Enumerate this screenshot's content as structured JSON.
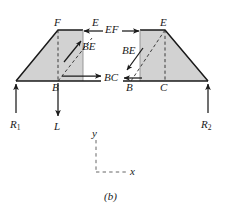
{
  "figure": {
    "caption": "(b)",
    "type": "free-body-diagram"
  },
  "colors": {
    "fill_gray": "#d2d2d2",
    "stroke": "#1a1a1a",
    "axis": "#555555",
    "background": "#ffffff"
  },
  "labels": {
    "joint_F_left": "F",
    "force_E_top_left": "E",
    "force_EF_center": "EF",
    "joint_E_right": "E",
    "force_BE_left": "BE",
    "force_BE_right": "BE",
    "joint_B_left": "B",
    "force_BC_center": "BC",
    "joint_B_right": "B",
    "joint_C_right": "C",
    "reaction_left": "R",
    "reaction_left_sub": "1",
    "load_L": "L",
    "reaction_right": "R",
    "reaction_right_sub": "2",
    "axis_y": "y",
    "axis_x": "x"
  },
  "forces": [
    {
      "name": "EF",
      "side": "left",
      "direction": "left",
      "applied_at": "F-top-right"
    },
    {
      "name": "EF",
      "side": "right",
      "direction": "right",
      "applied_at": "E-top-left"
    },
    {
      "name": "BE",
      "side": "left",
      "direction": "up-right",
      "applied_at": "diagonal"
    },
    {
      "name": "BE",
      "side": "right",
      "direction": "down-left",
      "applied_at": "diagonal"
    },
    {
      "name": "BC",
      "side": "left",
      "direction": "right",
      "applied_at": "B-baseline"
    },
    {
      "name": "BC",
      "side": "right",
      "direction": "left",
      "applied_at": "B-baseline"
    },
    {
      "name": "R1",
      "side": "left",
      "direction": "up",
      "applied_at": "left-support"
    },
    {
      "name": "L",
      "side": "left",
      "direction": "down",
      "applied_at": "B"
    },
    {
      "name": "R2",
      "side": "right",
      "direction": "up",
      "applied_at": "right-support"
    }
  ],
  "axes": {
    "style": "dashed",
    "origin_label": "",
    "y_direction": "up",
    "x_direction": "right"
  }
}
